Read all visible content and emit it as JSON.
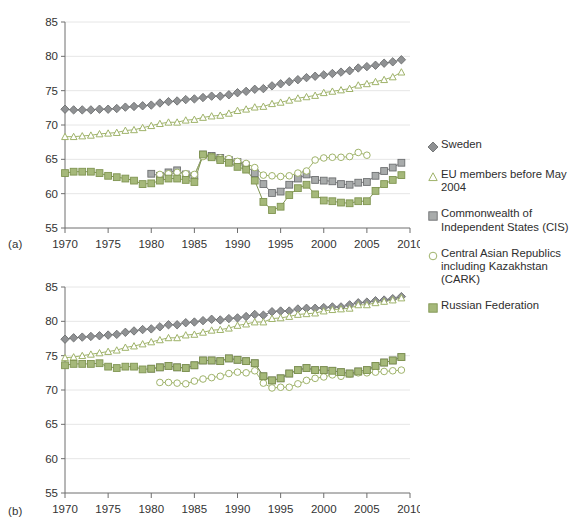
{
  "figure": {
    "panel_a_label": "(a)",
    "panel_b_label": "(b)"
  },
  "legend": {
    "position": "right",
    "entries": [
      {
        "name": "Sweden",
        "label": "Sweden",
        "marker": "diamond-filled",
        "color": "#8f9193",
        "edge": "#6d6f71"
      },
      {
        "name": "EU members before May 2004",
        "label": "EU members before May 2004",
        "marker": "triangle-open",
        "color": "#ffffff",
        "edge": "#9fb36a"
      },
      {
        "name": "Commonwealth of Independent States (CIS)",
        "label": "Commonwealth of Independent States (CIS)",
        "marker": "square-filled-grey",
        "color": "#a8abab",
        "edge": "#6d6f71"
      },
      {
        "name": "Central Asian Republics including Kazakhstan (CARK)",
        "label": "Central Asian Republics including Kazakhstan (CARK)",
        "marker": "circle-open",
        "color": "#ffffff",
        "edge": "#9fb36a"
      },
      {
        "name": "Russian Federation",
        "label": "Russian Federation",
        "marker": "square-filled-green",
        "color": "#a5b87a",
        "edge": "#7f9450"
      }
    ]
  },
  "chart_data": [
    {
      "id": "panel-a",
      "type": "line",
      "title": "",
      "xlabel": "",
      "ylabel": "",
      "xlim": [
        1970,
        2010
      ],
      "ylim": [
        55,
        85
      ],
      "xticks": [
        1970,
        1975,
        1980,
        1985,
        1990,
        1995,
        2000,
        2005,
        2010
      ],
      "yticks": [
        55,
        60,
        65,
        70,
        75,
        80,
        85
      ],
      "grid": "horizontal",
      "series": [
        {
          "name": "Sweden",
          "marker": "diamond-filled",
          "color": "#8f9193",
          "edge": "#6d6f71",
          "x": [
            1970,
            1971,
            1972,
            1973,
            1974,
            1975,
            1976,
            1977,
            1978,
            1979,
            1980,
            1981,
            1982,
            1983,
            1984,
            1985,
            1986,
            1987,
            1988,
            1989,
            1990,
            1991,
            1992,
            1993,
            1994,
            1995,
            1996,
            1997,
            1998,
            1999,
            2000,
            2001,
            2002,
            2003,
            2004,
            2005,
            2006,
            2007,
            2008,
            2009
          ],
          "values": [
            72.3,
            72.2,
            72.2,
            72.2,
            72.3,
            72.3,
            72.4,
            72.6,
            72.7,
            72.8,
            72.9,
            73.2,
            73.4,
            73.5,
            73.7,
            73.8,
            74.0,
            74.2,
            74.2,
            74.4,
            74.7,
            74.9,
            75.2,
            75.3,
            75.7,
            76.0,
            76.3,
            76.6,
            76.9,
            77.1,
            77.3,
            77.5,
            77.7,
            77.9,
            78.3,
            78.5,
            78.7,
            79.0,
            79.2,
            79.5
          ]
        },
        {
          "name": "EU members before May 2004",
          "marker": "triangle-open",
          "color": "#ffffff",
          "edge": "#9fb36a",
          "x": [
            1970,
            1971,
            1972,
            1973,
            1974,
            1975,
            1976,
            1977,
            1978,
            1979,
            1980,
            1981,
            1982,
            1983,
            1984,
            1985,
            1986,
            1987,
            1988,
            1989,
            1990,
            1991,
            1992,
            1993,
            1994,
            1995,
            1996,
            1997,
            1998,
            1999,
            2000,
            2001,
            2002,
            2003,
            2004,
            2005,
            2006,
            2007,
            2008,
            2009
          ],
          "values": [
            68.3,
            68.3,
            68.4,
            68.5,
            68.7,
            68.8,
            68.9,
            69.2,
            69.3,
            69.6,
            69.9,
            70.2,
            70.4,
            70.4,
            70.7,
            70.8,
            71.1,
            71.3,
            71.4,
            71.7,
            72.1,
            72.3,
            72.6,
            72.7,
            73.1,
            73.3,
            73.6,
            73.9,
            74.1,
            74.3,
            74.7,
            74.9,
            75.1,
            75.3,
            75.8,
            76.0,
            76.3,
            76.6,
            77.0,
            77.7
          ]
        },
        {
          "name": "Commonwealth of Independent States (CIS)",
          "marker": "square-filled-grey",
          "color": "#a8abab",
          "edge": "#6d6f71",
          "x": [
            1980,
            1981,
            1982,
            1983,
            1984,
            1985,
            1986,
            1987,
            1988,
            1989,
            1990,
            1991,
            1992,
            1993,
            1994,
            1995,
            1996,
            1997,
            1998,
            1999,
            2000,
            2001,
            2002,
            2003,
            2004,
            2005,
            2006,
            2007,
            2008,
            2009
          ],
          "values": [
            62.9,
            62.6,
            63.1,
            63.4,
            62.8,
            62.6,
            65.7,
            65.5,
            65.2,
            64.9,
            64.6,
            64.1,
            63.0,
            61.4,
            60.1,
            60.3,
            61.3,
            62.2,
            62.8,
            62.0,
            61.9,
            61.8,
            61.4,
            61.3,
            61.6,
            61.7,
            62.6,
            63.3,
            63.8,
            64.5
          ]
        },
        {
          "name": "Central Asian Republics including Kazakhstan (CARK)",
          "marker": "circle-open",
          "color": "#ffffff",
          "edge": "#9fb36a",
          "x": [
            1981,
            1982,
            1983,
            1984,
            1985,
            1986,
            1987,
            1988,
            1989,
            1990,
            1991,
            1992,
            1993,
            1994,
            1995,
            1996,
            1997,
            1998,
            1999,
            2000,
            2001,
            2002,
            2003,
            2004,
            2005
          ],
          "values": [
            62.8,
            62.9,
            63.1,
            62.9,
            62.8,
            65.4,
            65.4,
            65.2,
            65.1,
            64.7,
            64.4,
            63.8,
            62.7,
            62.6,
            62.5,
            62.6,
            63.0,
            63.3,
            64.9,
            65.2,
            65.3,
            65.3,
            65.4,
            66.0,
            65.6
          ]
        },
        {
          "name": "Russian Federation",
          "marker": "square-filled-green",
          "color": "#a5b87a",
          "edge": "#7f9450",
          "x": [
            1970,
            1971,
            1972,
            1973,
            1974,
            1975,
            1976,
            1977,
            1978,
            1979,
            1980,
            1981,
            1982,
            1983,
            1984,
            1985,
            1986,
            1987,
            1988,
            1989,
            1990,
            1991,
            1992,
            1993,
            1994,
            1995,
            1996,
            1997,
            1998,
            1999,
            2000,
            2001,
            2002,
            2003,
            2004,
            2005,
            2006,
            2007,
            2008,
            2009
          ],
          "values": [
            63.0,
            63.2,
            63.2,
            63.2,
            63.0,
            62.6,
            62.4,
            62.2,
            61.9,
            61.4,
            61.5,
            61.9,
            62.2,
            62.2,
            62.0,
            61.7,
            65.7,
            65.3,
            64.9,
            64.5,
            63.9,
            63.5,
            61.9,
            58.8,
            57.6,
            58.1,
            59.8,
            60.8,
            61.3,
            59.9,
            59.0,
            58.9,
            58.7,
            58.6,
            58.9,
            58.9,
            60.4,
            61.4,
            62.0,
            62.7
          ]
        }
      ]
    },
    {
      "id": "panel-b",
      "type": "line",
      "title": "",
      "xlabel": "",
      "ylabel": "",
      "xlim": [
        1970,
        2010
      ],
      "ylim": [
        55,
        85
      ],
      "xticks": [
        1970,
        1975,
        1980,
        1985,
        1990,
        1995,
        2000,
        2005,
        2010
      ],
      "yticks": [
        55,
        60,
        65,
        70,
        75,
        80,
        85
      ],
      "grid": "horizontal",
      "series": [
        {
          "name": "Sweden",
          "marker": "diamond-filled",
          "color": "#8f9193",
          "edge": "#6d6f71",
          "x": [
            1970,
            1971,
            1972,
            1973,
            1974,
            1975,
            1976,
            1977,
            1978,
            1979,
            1980,
            1981,
            1982,
            1983,
            1984,
            1985,
            1986,
            1987,
            1988,
            1989,
            1990,
            1991,
            1992,
            1993,
            1994,
            1995,
            1996,
            1997,
            1998,
            1999,
            2000,
            2001,
            2002,
            2003,
            2004,
            2005,
            2006,
            2007,
            2008,
            2009
          ],
          "values": [
            77.4,
            77.6,
            77.7,
            77.8,
            77.9,
            78.0,
            78.1,
            78.4,
            78.6,
            78.8,
            78.9,
            79.2,
            79.5,
            79.5,
            79.8,
            79.9,
            80.1,
            80.3,
            80.2,
            80.4,
            80.5,
            80.7,
            81.0,
            80.9,
            81.4,
            81.5,
            81.5,
            81.8,
            81.9,
            81.9,
            82.0,
            82.1,
            82.1,
            82.4,
            82.7,
            82.8,
            83.0,
            83.1,
            83.3,
            83.6
          ]
        },
        {
          "name": "EU members before May 2004",
          "marker": "triangle-open",
          "color": "#ffffff",
          "edge": "#9fb36a",
          "x": [
            1970,
            1971,
            1972,
            1973,
            1974,
            1975,
            1976,
            1977,
            1978,
            1979,
            1980,
            1981,
            1982,
            1983,
            1984,
            1985,
            1986,
            1987,
            1988,
            1989,
            1990,
            1991,
            1992,
            1993,
            1994,
            1995,
            1996,
            1997,
            1998,
            1999,
            2000,
            2001,
            2002,
            2003,
            2004,
            2005,
            2006,
            2007,
            2008,
            2009
          ],
          "values": [
            74.7,
            74.8,
            75.0,
            75.2,
            75.4,
            75.6,
            75.8,
            76.2,
            76.4,
            76.7,
            77.0,
            77.3,
            77.6,
            77.6,
            78.0,
            78.1,
            78.4,
            78.7,
            78.8,
            79.0,
            79.4,
            79.6,
            79.9,
            79.9,
            80.4,
            80.5,
            80.7,
            81.0,
            81.1,
            81.2,
            81.5,
            81.7,
            81.8,
            81.9,
            82.4,
            82.4,
            82.7,
            82.9,
            83.1,
            83.4
          ]
        },
        {
          "name": "Commonwealth of Independent States (CIS)",
          "marker": "square-filled-grey",
          "color": "#a8abab",
          "edge": "#6d6f71",
          "x": [
            1980,
            1981,
            1982,
            1983,
            1984,
            1985,
            1986,
            1987,
            1988,
            1989,
            1990,
            1991,
            1992,
            1993,
            1994,
            1995,
            1996,
            1997,
            1998,
            1999,
            2000,
            2001,
            2002,
            2003,
            2004,
            2005,
            2006,
            2007,
            2008,
            2009
          ],
          "values": [
            73.1,
            73.3,
            73.5,
            73.3,
            73.2,
            73.6,
            74.3,
            74.3,
            74.2,
            74.6,
            74.4,
            74.2,
            73.9,
            72.0,
            71.4,
            71.7,
            72.4,
            72.9,
            73.2,
            72.9,
            72.9,
            72.8,
            72.6,
            72.4,
            72.7,
            72.9,
            73.5,
            74.0,
            74.3,
            74.8
          ]
        },
        {
          "name": "Central Asian Republics including Kazakhstan (CARK)",
          "marker": "circle-open",
          "color": "#ffffff",
          "edge": "#9fb36a",
          "x": [
            1981,
            1982,
            1983,
            1984,
            1985,
            1986,
            1987,
            1988,
            1989,
            1990,
            1991,
            1992,
            1993,
            1994,
            1995,
            1996,
            1997,
            1998,
            1999,
            2000,
            2001,
            2002,
            2003,
            2004,
            2005,
            2006,
            2007,
            2008,
            2009
          ],
          "values": [
            71.1,
            71.1,
            71.0,
            70.9,
            71.3,
            71.6,
            71.8,
            72.0,
            72.4,
            72.6,
            72.5,
            72.8,
            71.0,
            70.3,
            70.4,
            70.4,
            70.9,
            71.4,
            71.7,
            71.9,
            72.2,
            72.0,
            72.3,
            72.5,
            72.5,
            72.6,
            72.7,
            72.8,
            72.9
          ]
        },
        {
          "name": "Russian Federation",
          "marker": "square-filled-green",
          "color": "#a5b87a",
          "edge": "#7f9450",
          "x": [
            1970,
            1971,
            1972,
            1973,
            1974,
            1975,
            1976,
            1977,
            1978,
            1979,
            1980,
            1981,
            1982,
            1983,
            1984,
            1985,
            1986,
            1987,
            1988,
            1989,
            1990,
            1991,
            1992,
            1993,
            1994,
            1995,
            1996,
            1997,
            1998,
            1999,
            2000,
            2001,
            2002,
            2003,
            2004,
            2005,
            2006,
            2007,
            2008,
            2009
          ],
          "values": [
            73.6,
            73.8,
            73.8,
            73.8,
            73.9,
            73.4,
            73.2,
            73.4,
            73.4,
            73.0,
            73.1,
            73.3,
            73.5,
            73.3,
            73.2,
            73.6,
            74.3,
            74.3,
            74.2,
            74.6,
            74.4,
            74.2,
            73.9,
            72.0,
            71.4,
            71.7,
            72.4,
            72.9,
            73.2,
            72.9,
            72.9,
            72.8,
            72.6,
            72.4,
            72.7,
            72.9,
            73.5,
            74.0,
            74.3,
            74.8
          ]
        }
      ]
    }
  ]
}
